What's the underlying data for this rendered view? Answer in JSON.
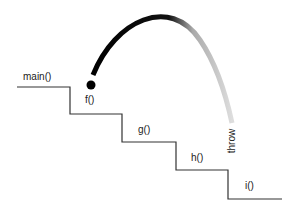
{
  "diagram": {
    "title": "",
    "frames": [
      {
        "label": "main()",
        "x": 23,
        "y": 72
      },
      {
        "label": "f()",
        "x": 85,
        "y": 95
      },
      {
        "label": "g()",
        "x": 138,
        "y": 125
      },
      {
        "label": "h()",
        "x": 191,
        "y": 153
      },
      {
        "label": "i()",
        "x": 245,
        "y": 181
      }
    ],
    "throw_label": "throw",
    "colors": {
      "stairs": "#333333",
      "arc_start": "#000000",
      "arc_end": "#d8d8d8",
      "dot": "#000000",
      "text": "#222222"
    }
  }
}
